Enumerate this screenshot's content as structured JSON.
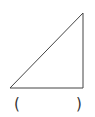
{
  "diagram": {
    "shape": "right-triangle",
    "vertices": [
      [
        10,
        88
      ],
      [
        83,
        88
      ],
      [
        83,
        13
      ]
    ],
    "stroke_color": "#444444"
  },
  "answer_blank": {
    "open_paren": "(",
    "close_paren": ")",
    "value": ""
  }
}
